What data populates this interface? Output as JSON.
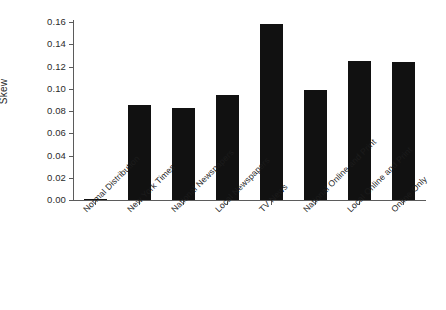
{
  "chart_data": {
    "type": "bar",
    "title": "",
    "xlabel": "",
    "ylabel": "Skew",
    "ylim": [
      0.0,
      0.16
    ],
    "grid": false,
    "legend": null,
    "bar_color": "#111111",
    "axis_color": "#5b5b5b",
    "ytick_labels": [
      "0.16",
      "0.14",
      "0.12",
      "0.10",
      "0.08",
      "0.06",
      "0.04",
      "0.02",
      "0.00"
    ],
    "ytick_values": [
      0.16,
      0.14,
      0.12,
      0.1,
      0.08,
      0.06,
      0.04,
      0.02,
      0.0
    ],
    "categories": [
      "Normal Distribution",
      "New York Times",
      "National Newspapers",
      "Local Newspapers",
      "TV News",
      "National Online and Print",
      "Local Online and Print",
      "Online Only"
    ],
    "values": [
      0.001,
      0.0855,
      0.083,
      0.094,
      0.158,
      0.099,
      0.125,
      0.124
    ]
  }
}
